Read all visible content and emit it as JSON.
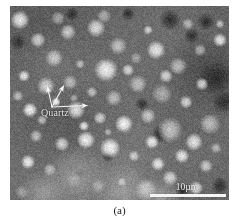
{
  "figure": {
    "caption": "(a)",
    "panel_label": "(a)",
    "type": "sem-backscatter-micrograph",
    "background_color": "#ffffff"
  },
  "micrograph": {
    "name": "sem-micrograph-a",
    "matrix_color": "#6b6b6b",
    "particle_color": "#bcbcbc",
    "dark_pore_color": "#2b2b2b",
    "width_px": 219,
    "height_px": 194
  },
  "annotations": {
    "quartz": {
      "label": "Quartz",
      "color": "#f2f2f2",
      "arrow_count": 3,
      "arrows": [
        {
          "name": "quartz-arrow-upper-left",
          "x1": 42,
          "y1": 101,
          "x2": 37,
          "y2": 80
        },
        {
          "name": "quartz-arrow-upper-right",
          "x1": 42,
          "y1": 101,
          "x2": 54,
          "y2": 79
        },
        {
          "name": "quartz-arrow-right",
          "x1": 42,
          "y1": 101,
          "x2": 78,
          "y2": 99
        }
      ]
    }
  },
  "scale_bar": {
    "label": "10µm",
    "value": 10,
    "unit": "µm",
    "color": "#f4f4f4",
    "length_px": 76
  },
  "chart_data": {
    "type": "heatmap",
    "title": "(a)",
    "xlabel": "",
    "ylabel": "",
    "annotations": [
      "Quartz",
      "10µm"
    ]
  }
}
